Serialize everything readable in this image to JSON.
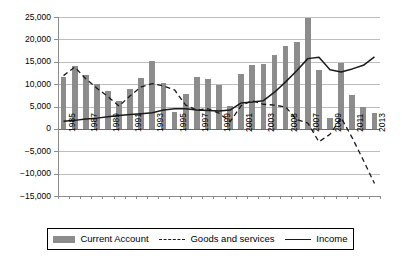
{
  "chart_data": {
    "type": "bar",
    "title": "",
    "subtitle": "",
    "xlabel": "",
    "ylabel": "",
    "ylim": [
      -15000,
      25000
    ],
    "ytick_step": 5000,
    "grid": true,
    "legend_position": "bottom",
    "ytick_labels": [
      "25,000",
      "20,000",
      "15,000",
      "10,000",
      "5,000",
      "0",
      "−5,000",
      "−10,000",
      "−15,000"
    ],
    "ytick_values": [
      25000,
      20000,
      15000,
      10000,
      5000,
      0,
      -5000,
      -10000,
      -15000
    ],
    "categories": [
      "1985",
      "1986",
      "1987",
      "1988",
      "1989",
      "1990",
      "1991",
      "1992",
      "1993",
      "1994",
      "1995",
      "1996",
      "1997",
      "1998",
      "1999",
      "2000",
      "2001",
      "2002",
      "2003",
      "2004",
      "2005",
      "2006",
      "2007",
      "2008",
      "2009",
      "2010",
      "2011",
      "2012",
      "2013"
    ],
    "xtick_labels_shown": [
      "1985",
      "1987",
      "1989",
      "1991",
      "1993",
      "1995",
      "1997",
      "1999",
      "2001",
      "2003",
      "2005",
      "2007",
      "2009",
      "2011",
      "2013"
    ],
    "series": [
      {
        "name": "Current Account",
        "type": "bar",
        "color": "#8c8c8c",
        "values": [
          11700,
          14100,
          12100,
          10000,
          8500,
          6300,
          9000,
          11400,
          15100,
          10300,
          3800,
          7700,
          11500,
          11200,
          9800,
          5200,
          12200,
          14200,
          14600,
          16600,
          18500,
          19500,
          24800,
          13200,
          2400,
          14700,
          7600,
          5000,
          3500
        ]
      },
      {
        "name": "Goods and services",
        "type": "line",
        "style": "dashed",
        "color": "#1a1a1a",
        "values": [
          11900,
          13800,
          11200,
          9100,
          7200,
          5100,
          7400,
          9400,
          10100,
          9600,
          8700,
          5300,
          4200,
          4500,
          3500,
          1600,
          5200,
          6300,
          5500,
          5300,
          4900,
          2100,
          1300,
          -2900,
          -1200,
          2500,
          -2000,
          -7000,
          -12200
        ]
      },
      {
        "name": "Income",
        "type": "line",
        "style": "solid",
        "color": "#1a1a1a",
        "values": [
          1700,
          1900,
          2200,
          2400,
          2700,
          3000,
          3200,
          3400,
          3600,
          4200,
          4500,
          4500,
          4200,
          4100,
          4000,
          4200,
          5800,
          6000,
          6300,
          8200,
          10500,
          13000,
          15700,
          16000,
          13200,
          12700,
          13400,
          14200,
          16100
        ]
      }
    ]
  },
  "legend": {
    "items": [
      {
        "label": "Current Account",
        "marker": "bar-swatch"
      },
      {
        "label": "Goods and services",
        "marker": "dashed-line-swatch"
      },
      {
        "label": "Income",
        "marker": "solid-line-swatch"
      }
    ]
  },
  "colors": {
    "bar": "#8c8c8c",
    "line": "#1a1a1a",
    "grid": "#bdbdbd",
    "axis": "#8c8c8c",
    "background": "#ffffff"
  }
}
